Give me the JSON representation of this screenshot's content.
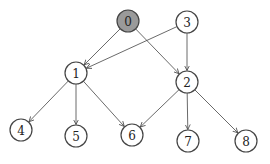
{
  "diagram": {
    "type": "directed-graph",
    "colors": {
      "highlight_fill": "#9a9a9a",
      "node_fill": "#ffffff",
      "stroke": "#444444"
    },
    "nodes": [
      {
        "id": "0",
        "label": "0",
        "x": 128,
        "y": 21,
        "highlighted": true
      },
      {
        "id": "1",
        "label": "1",
        "x": 76,
        "y": 73
      },
      {
        "id": "2",
        "label": "2",
        "x": 187,
        "y": 82
      },
      {
        "id": "3",
        "label": "3",
        "x": 187,
        "y": 22
      },
      {
        "id": "4",
        "label": "4",
        "x": 21,
        "y": 130
      },
      {
        "id": "5",
        "label": "5",
        "x": 76,
        "y": 136
      },
      {
        "id": "6",
        "label": "6",
        "x": 132,
        "y": 135
      },
      {
        "id": "7",
        "label": "7",
        "x": 188,
        "y": 141
      },
      {
        "id": "8",
        "label": "8",
        "x": 246,
        "y": 141
      }
    ],
    "edges": [
      {
        "from": "0",
        "to": "1"
      },
      {
        "from": "0",
        "to": "2"
      },
      {
        "from": "3",
        "to": "1"
      },
      {
        "from": "3",
        "to": "2"
      },
      {
        "from": "1",
        "to": "4"
      },
      {
        "from": "1",
        "to": "5"
      },
      {
        "from": "1",
        "to": "6"
      },
      {
        "from": "2",
        "to": "6"
      },
      {
        "from": "2",
        "to": "7"
      },
      {
        "from": "2",
        "to": "8"
      }
    ]
  }
}
